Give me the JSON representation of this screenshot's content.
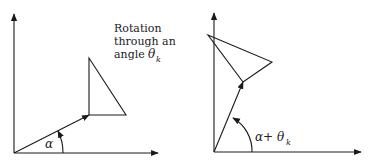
{
  "left_panel": {
    "caption_lines": [
      "Rotation",
      "through an",
      "angle "
    ],
    "caption_theta": "θ",
    "caption_sub": "k",
    "angle_label": "α"
  },
  "right_panel": {
    "angle_label_main": "α+ θ",
    "angle_label_sub": "k"
  },
  "colors": {
    "stroke": "#1a1a1a",
    "background": "#ffffff"
  }
}
